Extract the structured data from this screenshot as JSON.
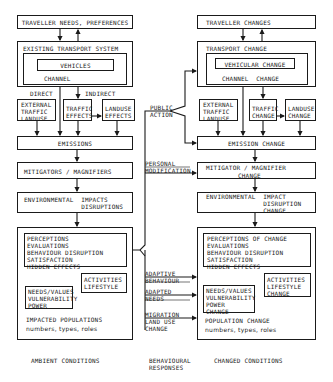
{
  "left": {
    "traveller": "TRAVELLER NEEDS, PREFERENCES",
    "transport_title": "EXISTING TRANSPORT SYSTEM",
    "vehicles": "VEHICLES",
    "channel": "CHANNEL",
    "direct": "DIRECT",
    "indirect": "INDIRECT",
    "external": "EXTERNAL\nTRAFFIC\nLANDUSE",
    "traffic": "TRAFFIC\nEFFECTS",
    "landuse": "LANDUSE\nEFFECTS",
    "emissions": "EMISSIONS",
    "mitigators": "MITIGATORS / MAGNIFIERS",
    "env": "ENVIRONMENTAL  IMPACTS\n               DISRUPTIONS",
    "perceptions": "PERCEPTIONS\nEVALUATIONS\nBEHAVIOUR DISRUPTION\nSATISFACTION\nHIDDEN EFFECTS",
    "activities": "ACTIVITIES\nLIFESTYLE",
    "needs": "NEEDS/VALUES\nVULNERABILITY\nPOWER",
    "population": "IMPACTED POPULATIONS",
    "population_sub": "numbers, types, roles",
    "footer": "AMBIENT CONDITIONS"
  },
  "middle": {
    "public_action": "PUBLIC\nACTION",
    "personal_mod": "PERSONAL\nMODIFICATION",
    "adaptive_behaviour": "ADAPTIVE\nBEHAVIOUR",
    "adapted_needs": "ADAPTED\nNEEDS",
    "migration": "MIGRATION\nLAND USE\nCHANGE",
    "footer": "BEHAVIOURAL\nRESPONSES"
  },
  "right": {
    "traveller": "TRAVELLER CHANGES",
    "transport_title": "TRANSPORT CHANGE",
    "vehicles": "VEHICULAR CHANGE",
    "channel": "CHANNEL  CHANGE",
    "external": "EXTERNAL\nTRAFFIC\nLANDUSE",
    "traffic": "TRAFFIC\nCHANGE",
    "landuse": "LANDUSE\nCHANGE",
    "emissions": "EMISSION CHANGE",
    "mitigators": "MITIGATOR / MAGNIFIER",
    "mitigators2": "CHANGE",
    "env": "ENVIRONMENTAL  IMPACT\n               DISRUPTION\n               CHANGE",
    "perceptions": "PERCEPTIONS OF CHANGE\nEVALUATIONS\nBEHAVIOUR DISRUPTION\nSATISFACTION\nHIDDEN EFFECTS",
    "activities": "ACTIVITIES\nLIFESTYLE\nCHANGE",
    "needs": "NEEDS/VALUES\nVULNERABILITY\nPOWER\nCHANGE",
    "population": "POPULATION CHANGE",
    "population_sub": "numbers, types, roles",
    "footer": "CHANGED CONDITIONS"
  }
}
